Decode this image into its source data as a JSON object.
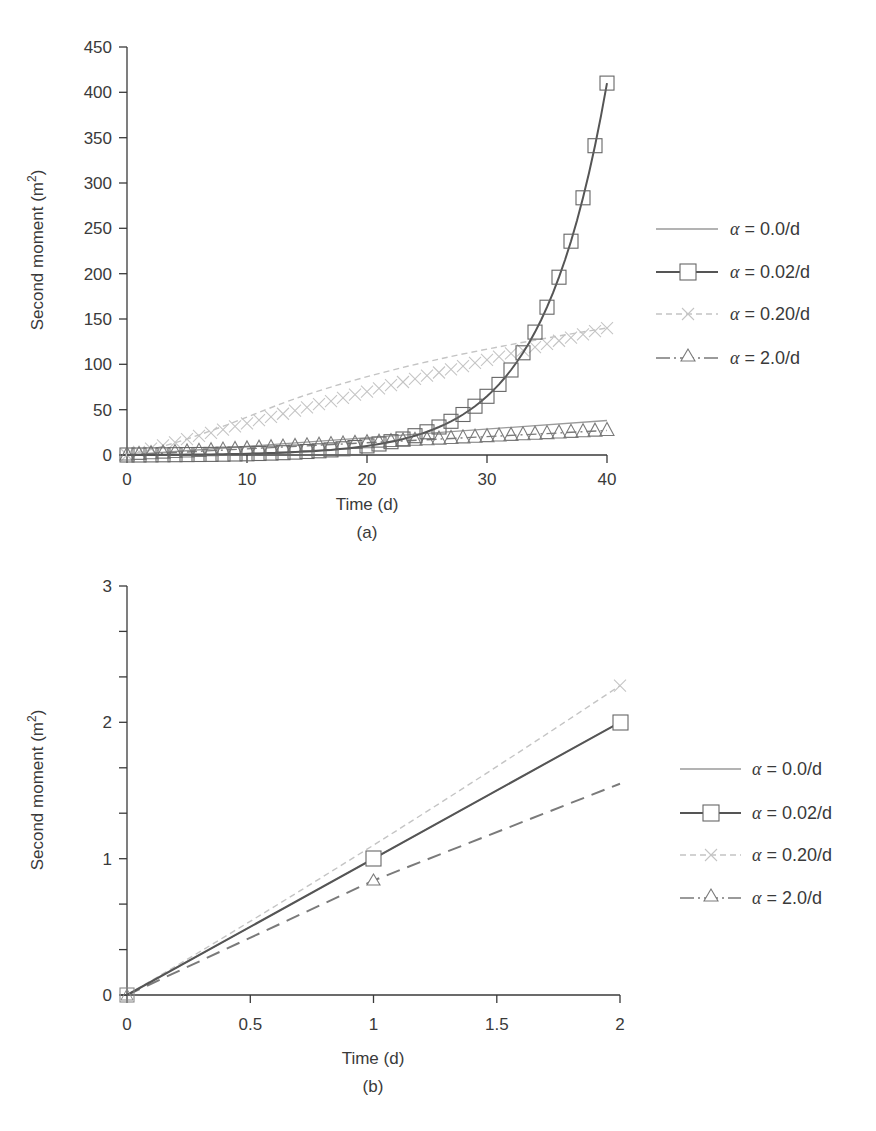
{
  "chart_data": [
    {
      "panel": "(a)",
      "type": "line",
      "xlabel": "Time (d)",
      "ylabel": "Second moment (m²)",
      "xlim": [
        0,
        40
      ],
      "ylim": [
        0,
        450
      ],
      "xticks": [
        0,
        10,
        20,
        30,
        40
      ],
      "yticks": [
        0,
        50,
        100,
        150,
        200,
        250,
        300,
        350,
        400,
        450
      ],
      "grid": false,
      "legend_position": "right",
      "series": [
        {
          "name": "α = 0.0/d",
          "style": "solid thin light-gray",
          "marker": "none",
          "x": [
            0,
            10,
            20,
            30,
            40
          ],
          "values": [
            0,
            9.5,
            19,
            28.5,
            38
          ]
        },
        {
          "name": "α = 0.02/d",
          "style": "solid dark-gray",
          "marker": "square",
          "x": [
            0,
            5,
            10,
            15,
            20,
            25,
            30,
            35,
            40
          ],
          "values": [
            0,
            2,
            12,
            30,
            55,
            102,
            180,
            285,
            413
          ]
        },
        {
          "name": "α = 0.20/d",
          "style": "dashed light-gray",
          "marker": "x",
          "x": [
            0,
            5,
            10,
            15,
            20,
            25,
            30,
            35,
            40
          ],
          "values": [
            0,
            17,
            35,
            53,
            70,
            88,
            105,
            123,
            140
          ]
        },
        {
          "name": "α = 2.0/d",
          "style": "dash-dot gray",
          "marker": "triangle",
          "x": [
            0,
            10,
            20,
            30,
            40
          ],
          "values": [
            0,
            7,
            14,
            20,
            27
          ]
        }
      ]
    },
    {
      "panel": "(b)",
      "type": "line",
      "xlabel": "Time (d)",
      "ylabel": "Second moment (m²)",
      "xlim": [
        0,
        2
      ],
      "ylim": [
        0,
        3
      ],
      "xticks": [
        0,
        0.5,
        1,
        1.5,
        2
      ],
      "yticks": [
        0,
        1,
        2,
        3
      ],
      "grid": false,
      "legend_position": "right",
      "series": [
        {
          "name": "α = 0.0/d",
          "style": "solid thin light-gray",
          "marker": "none",
          "x": [
            0,
            1,
            2
          ],
          "values": [
            0,
            1.0,
            2.0
          ]
        },
        {
          "name": "α = 0.02/d",
          "style": "solid dark-gray",
          "marker": "square",
          "x": [
            0,
            1,
            2
          ],
          "values": [
            0,
            1.0,
            2.0
          ]
        },
        {
          "name": "α = 0.20/d",
          "style": "dashed light-gray",
          "marker": "x",
          "x": [
            0,
            1,
            2
          ],
          "values": [
            0,
            1.02,
            2.27
          ]
        },
        {
          "name": "α = 2.0/d",
          "style": "dashed gray",
          "marker": "triangle",
          "x": [
            0,
            1,
            2
          ],
          "values": [
            0,
            0.84,
            1.55
          ]
        }
      ]
    }
  ],
  "panel_a": {
    "ylabel": "Second moment (m",
    "ylabel_sup": "2",
    "ylabel_close": ")",
    "xlabel": "Time (d)",
    "caption": "(a)",
    "yticks": [
      "0",
      "50",
      "100",
      "150",
      "200",
      "250",
      "300",
      "350",
      "400",
      "450"
    ],
    "xticks": [
      "0",
      "10",
      "20",
      "30",
      "40"
    ],
    "legend": [
      {
        "alpha": "α",
        "eq": " = ",
        "val": "0.0/d"
      },
      {
        "alpha": "α",
        "eq": " = ",
        "val": "0.02/d"
      },
      {
        "alpha": "α",
        "eq": " = ",
        "val": "0.20/d"
      },
      {
        "alpha": "α",
        "eq": " = ",
        "val": "2.0/d"
      }
    ]
  },
  "panel_b": {
    "ylabel": "Second moment (m",
    "ylabel_sup": "2",
    "ylabel_close": ")",
    "xlabel": "Time (d)",
    "caption": "(b)",
    "yticks": [
      "0",
      "1",
      "2",
      "3"
    ],
    "xticks": [
      "0",
      "0.5",
      "1",
      "1.5",
      "2"
    ],
    "legend": [
      {
        "alpha": "α",
        "eq": " = ",
        "val": "0.0/d"
      },
      {
        "alpha": "α",
        "eq": " = ",
        "val": "0.02/d"
      },
      {
        "alpha": "α",
        "eq": " = ",
        "val": "0.20/d"
      },
      {
        "alpha": "α",
        "eq": " = ",
        "val": "2.0/d"
      }
    ]
  },
  "colors": {
    "axis": "#3a3a3a",
    "alpha_0": "#9a9a9a",
    "alpha_002": "#555555",
    "alpha_020": "#c4c4c4",
    "alpha_2": "#7a7a7a"
  }
}
